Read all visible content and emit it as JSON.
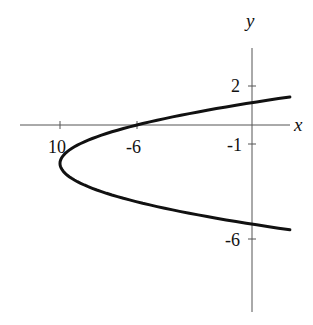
{
  "chart_data": {
    "type": "line",
    "title": "",
    "xlabel": "x",
    "ylabel": "y",
    "equation": "x = (y + 2)^2 - 10",
    "x_ticks": [
      {
        "value": -10,
        "label": "10"
      },
      {
        "value": -6,
        "label": "-6"
      }
    ],
    "y_ticks": [
      {
        "value": 2,
        "label": "2"
      },
      {
        "value": -1,
        "label": "-1"
      },
      {
        "value": -6,
        "label": "-6"
      }
    ],
    "xlim": [
      -12,
      2
    ],
    "ylim": [
      -11,
      5
    ],
    "grid": false,
    "series": [
      {
        "name": "parabola",
        "points": [
          {
            "x": 2.0,
            "y": 1.46
          },
          {
            "x": 0.0,
            "y": 1.16
          },
          {
            "x": -6.0,
            "y": 0.0
          },
          {
            "x": -9.0,
            "y": -1.0
          },
          {
            "x": -10.0,
            "y": -2.0
          },
          {
            "x": -9.0,
            "y": -3.0
          },
          {
            "x": -6.0,
            "y": -4.0
          },
          {
            "x": 0.0,
            "y": -5.16
          },
          {
            "x": 2.0,
            "y": -5.46
          }
        ]
      }
    ],
    "vertex": {
      "x": -10,
      "y": -2
    },
    "line_color": "#111111"
  },
  "axes": {
    "x_label": "x",
    "y_label": "y"
  },
  "ticks": {
    "x_neg10": "10",
    "x_neg6": "-6",
    "y_2": "2",
    "y_neg1": "-1",
    "y_neg6": "-6"
  }
}
